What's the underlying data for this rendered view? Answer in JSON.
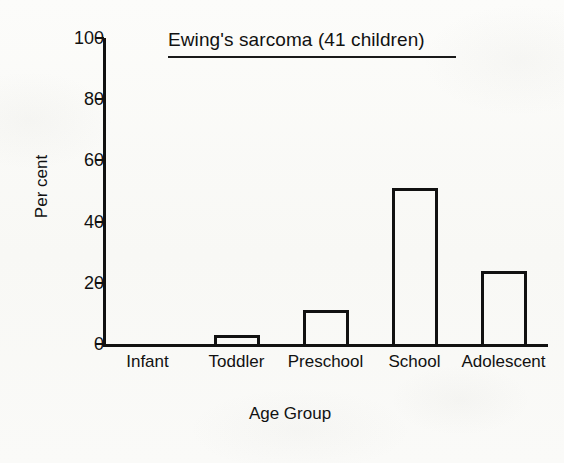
{
  "chart_data": {
    "type": "bar",
    "title": "Ewing's sarcoma (41 children)",
    "xlabel": "Age Group",
    "ylabel": "Per cent",
    "categories": [
      "Infant",
      "Toddler",
      "Preschool",
      "School",
      "Adolescent"
    ],
    "values": [
      0,
      3,
      11,
      51,
      24
    ],
    "ylim": [
      0,
      100
    ],
    "yticks": [
      0,
      20,
      40,
      60,
      80,
      100
    ],
    "ytick_labels": [
      "0",
      "20",
      "40",
      "60",
      "80",
      "100"
    ],
    "grid": false,
    "legend": null,
    "bar_style": "outline",
    "bar_color": "#111111"
  },
  "colors": {
    "ink": "#111111",
    "paper": "#fbfbf9"
  }
}
